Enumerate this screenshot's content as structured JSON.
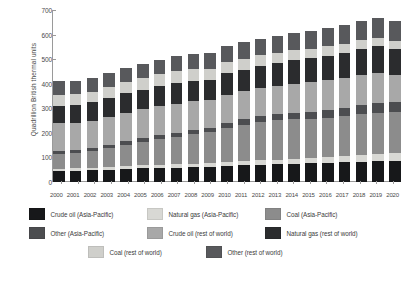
{
  "chart_data": {
    "type": "bar",
    "subtype": "stacked-vertical",
    "title": "",
    "xlabel": "",
    "ylabel": "Quadrillion British thermal units",
    "ylim": [
      0,
      700
    ],
    "yticks": [
      0,
      100,
      200,
      300,
      400,
      500,
      600,
      700
    ],
    "grid": false,
    "legend_position": "bottom",
    "categories": [
      "2000",
      "2001",
      "2002",
      "2003",
      "2004",
      "2005",
      "2006",
      "2007",
      "2008",
      "2009",
      "2010",
      "2011",
      "2012",
      "2013",
      "2014",
      "2015",
      "2016",
      "2017",
      "2018",
      "2019",
      "2020"
    ],
    "series": [
      {
        "name": "Crude oil (Asia-Pacific)",
        "color": "#17181a",
        "values": [
          45,
          46,
          48,
          50,
          54,
          56,
          58,
          59,
          60,
          62,
          66,
          68,
          70,
          72,
          74,
          76,
          78,
          80,
          82,
          84,
          85
        ]
      },
      {
        "name": "Natural gas (Asia-Pacific)",
        "color": "#d8d8d4",
        "values": [
          10,
          10,
          11,
          11,
          12,
          12,
          13,
          13,
          14,
          15,
          16,
          17,
          18,
          19,
          20,
          22,
          24,
          26,
          28,
          30,
          32
        ]
      },
      {
        "name": "Coal (Asia-Pacific)",
        "color": "#8c8c8c",
        "values": [
          60,
          62,
          66,
          78,
          86,
          96,
          104,
          112,
          120,
          126,
          138,
          148,
          156,
          160,
          162,
          160,
          160,
          162,
          166,
          168,
          170
        ]
      },
      {
        "name": "Other (Asia-Pacific)",
        "color": "#4c4d50",
        "values": [
          10,
          11,
          12,
          13,
          14,
          15,
          16,
          17,
          18,
          19,
          21,
          22,
          24,
          25,
          27,
          29,
          31,
          33,
          36,
          38,
          40
        ]
      },
      {
        "name": "Crude oil (rest of world)",
        "color": "#a8a8a8",
        "values": [
          114,
          113,
          113,
          114,
          117,
          117,
          117,
          118,
          116,
          112,
          115,
          114,
          114,
          115,
          117,
          119,
          121,
          122,
          123,
          124,
          110
        ]
      },
      {
        "name": "Natural gas (rest of world)",
        "color": "#2b2c2e",
        "values": [
          72,
          72,
          74,
          75,
          78,
          79,
          81,
          84,
          85,
          82,
          88,
          89,
          91,
          93,
          95,
          97,
          99,
          102,
          106,
          108,
          105
        ]
      },
      {
        "name": "Coal (rest of world)",
        "color": "#cfcfcb",
        "values": [
          45,
          44,
          43,
          46,
          47,
          48,
          49,
          48,
          47,
          44,
          45,
          44,
          43,
          42,
          41,
          40,
          39,
          38,
          37,
          36,
          33
        ]
      },
      {
        "name": "Other (rest of world)",
        "color": "#58595c",
        "values": [
          54,
          55,
          55,
          56,
          57,
          58,
          60,
          62,
          63,
          64,
          66,
          67,
          68,
          70,
          72,
          73,
          75,
          76,
          78,
          80,
          82
        ]
      }
    ],
    "totals": [
      410,
      413,
      422,
      443,
      465,
      481,
      498,
      513,
      523,
      524,
      555,
      569,
      584,
      596,
      608,
      616,
      627,
      639,
      656,
      668,
      657
    ]
  },
  "axis": {
    "y_tick_labels": [
      "700",
      "600",
      "500",
      "400",
      "300",
      "200",
      "100",
      "0"
    ],
    "y_title": "Quadrillion British thermal units"
  },
  "legend": {
    "rows": [
      [
        {
          "label": "Crude oil (Asia-Pacific)",
          "color": "#17181a"
        },
        {
          "label": "Natural gas (Asia-Pacific)",
          "color": "#d8d8d4"
        },
        {
          "label": "Coal (Asia-Pacific)",
          "color": "#8c8c8c"
        }
      ],
      [
        {
          "label": "Other (Asia-Pacific)",
          "color": "#4c4d50"
        },
        {
          "label": "Crude oil (rest of world)",
          "color": "#a8a8a8"
        },
        {
          "label": "Natural gas (rest of world)",
          "color": "#2b2c2e"
        }
      ],
      [
        {
          "label": "Coal (rest of world)",
          "color": "#cfcfcb"
        },
        {
          "label": "Other (rest of world)",
          "color": "#58595c"
        }
      ]
    ]
  }
}
